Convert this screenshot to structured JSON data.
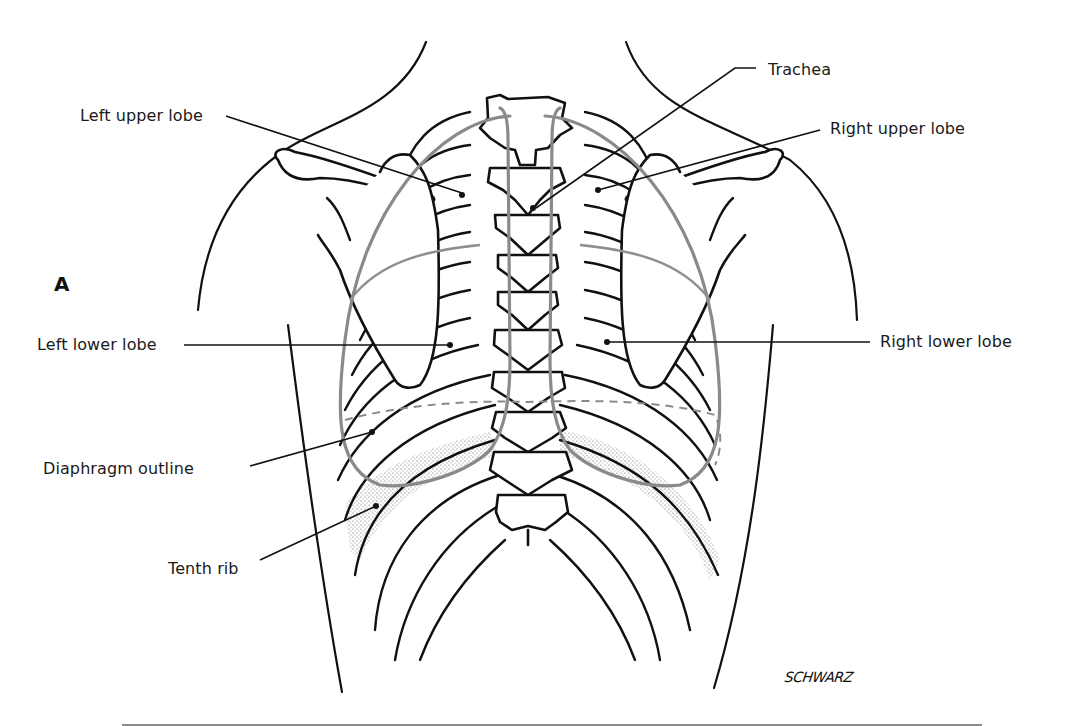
{
  "figure": {
    "panel_label": "A",
    "signature": "SCHWARZ",
    "labels": {
      "trachea": "Trachea",
      "left_upper_lobe": "Left upper lobe",
      "right_upper_lobe": "Right upper lobe",
      "left_lower_lobe": "Left lower lobe",
      "right_lower_lobe": "Right lower lobe",
      "diaphragm_outline": "Diaphragm outline",
      "tenth_rib": "Tenth rib"
    },
    "colors": {
      "ink": "#111111",
      "lung_outline": "#8a8a8a",
      "background": "#ffffff"
    }
  }
}
